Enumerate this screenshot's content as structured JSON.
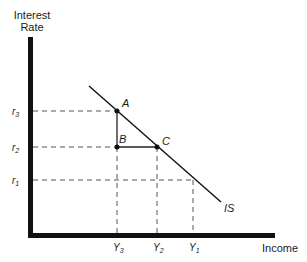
{
  "diagram": {
    "type": "IS curve",
    "y_axis_label_line1": "Interest",
    "y_axis_label_line2": "Rate",
    "x_axis_label": "Income",
    "curve_label": "IS",
    "rate_labels": [
      {
        "name": "r",
        "sub": "3"
      },
      {
        "name": "r",
        "sub": "2"
      },
      {
        "name": "r",
        "sub": "1"
      }
    ],
    "income_labels": [
      {
        "name": "Y",
        "sub": "3"
      },
      {
        "name": "Y",
        "sub": "2"
      },
      {
        "name": "Y",
        "sub": "1"
      }
    ],
    "points": [
      {
        "label": "A",
        "at": "(Y3, r3)"
      },
      {
        "label": "B",
        "at": "(Y3, r2)"
      },
      {
        "label": "C",
        "at": "(Y2, r2)"
      }
    ],
    "colors": {
      "ink": "#111111",
      "guide": "#555555",
      "background": "#ffffff"
    }
  }
}
